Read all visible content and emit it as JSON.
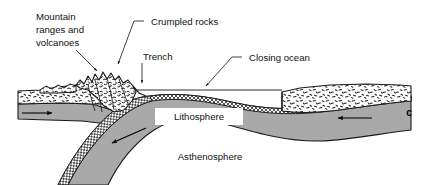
{
  "figure": {
    "panel_letter": "c",
    "background_color": "#ffffff",
    "ink_color": "#111111"
  },
  "labels": {
    "mountain": {
      "name": "mountain-ranges-and-volcanoes-label",
      "lines": [
        "Mountain",
        "ranges and",
        "volcanoes"
      ],
      "line1": "Mountain",
      "line2": "ranges and",
      "line3": "volcanoes",
      "leader": "arrow-down-right-to-mountain-peaks"
    },
    "crumpled": {
      "name": "crumpled-rocks-label",
      "text": "Crumpled rocks",
      "leader": "elbow-then-arrow-down-to-crumpled-zone"
    },
    "trench": {
      "name": "trench-label",
      "text": "Trench",
      "leader": "vertical-arrow-down-to-trench-notch"
    },
    "closing_ocean": {
      "name": "closing-ocean-label",
      "text": "Closing ocean",
      "leader": "elbow-then-diagonal-arrow-to-sea-surface"
    },
    "lithosphere": {
      "name": "lithosphere-label",
      "text": "Lithosphere",
      "style": "white-box-callout"
    },
    "asthenosphere": {
      "name": "asthenosphere-label",
      "text": "Asthenosphere",
      "style": "plain-text-on-gray"
    }
  },
  "layers": {
    "continental_crust": {
      "name": "continental-crust",
      "fill": "#ffffff",
      "texture": "stipple-dashes",
      "stroke": "#1a1a1a"
    },
    "oceanic_crust": {
      "name": "oceanic-crust",
      "fill": "#ffffff",
      "texture": "cross-hatch",
      "stroke": "#1a1a1a"
    },
    "lithosphere_mantle": {
      "name": "lithospheric-mantle",
      "fill": "#a9a9a9",
      "stroke": "#1a1a1a"
    },
    "asthenosphere_body": {
      "name": "asthenosphere-body",
      "fill": "#ffffff",
      "stroke": "#1a1a1a"
    },
    "subducting_slab": {
      "name": "subducting-slab",
      "fill": "#a9a9a9",
      "stroke": "#1a1a1a"
    },
    "sea_surface": {
      "name": "sea-surface-line",
      "stroke": "#1a1a1a"
    }
  },
  "motion": {
    "left_plate": {
      "name": "left-plate-motion-arrow",
      "direction": "right"
    },
    "right_plate": {
      "name": "right-plate-motion-arrow",
      "direction": "left"
    },
    "slab": {
      "name": "slab-descent-arrow",
      "direction": "down-left"
    }
  }
}
